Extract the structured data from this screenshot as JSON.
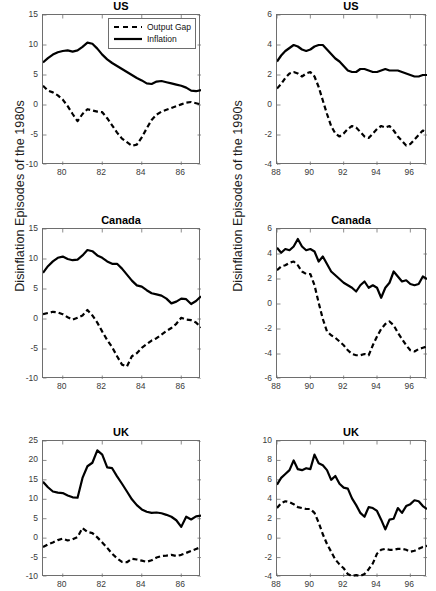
{
  "figure": {
    "row_labels": [
      "Disinflation Episodes of the 1980s",
      "Disinflation Episodes of the 1990s"
    ],
    "legend": {
      "output_gap": "Output Gap",
      "inflation": "Inflation"
    },
    "colors": {
      "line": "#000000",
      "axis": "#6e6e6e",
      "background": "#ffffff",
      "tick_text": "#3a3a3a"
    }
  },
  "chart_data": [
    {
      "id": "us-1980s",
      "type": "line",
      "title": "US",
      "xlabel": "",
      "ylabel": "",
      "xlim": [
        79,
        87
      ],
      "ylim": [
        -10,
        15
      ],
      "xticks": [
        80,
        82,
        84,
        86
      ],
      "yticks": [
        -10,
        -5,
        0,
        5,
        10,
        15
      ],
      "grid": false,
      "legend": "top-right",
      "x": [
        79,
        79.25,
        79.5,
        79.75,
        80,
        80.25,
        80.5,
        80.75,
        81,
        81.25,
        81.5,
        81.75,
        82,
        82.25,
        82.5,
        82.75,
        83,
        83.25,
        83.5,
        83.75,
        84,
        84.25,
        84.5,
        84.75,
        85,
        85.25,
        85.5,
        85.75,
        86,
        86.25,
        86.5,
        86.75,
        87
      ],
      "series": [
        {
          "name": "Inflation",
          "style": "solid",
          "values": [
            7.1,
            7.8,
            8.4,
            8.8,
            9.0,
            9.1,
            8.9,
            9.1,
            9.7,
            10.4,
            10.2,
            9.4,
            8.4,
            7.6,
            7.0,
            6.5,
            6.0,
            5.5,
            5.0,
            4.5,
            4.1,
            3.6,
            3.5,
            3.9,
            4.0,
            3.8,
            3.6,
            3.4,
            3.2,
            2.9,
            2.4,
            2.3,
            2.5
          ]
        },
        {
          "name": "Output Gap",
          "style": "dashed",
          "values": [
            3.2,
            2.4,
            2.1,
            1.6,
            0.9,
            -0.2,
            -1.5,
            -2.7,
            -1.5,
            -0.7,
            -0.9,
            -1.1,
            -1.2,
            -2.2,
            -3.4,
            -4.6,
            -5.6,
            -6.2,
            -6.8,
            -6.6,
            -5.4,
            -3.9,
            -2.5,
            -1.6,
            -1.1,
            -0.8,
            -0.5,
            -0.2,
            0.1,
            0.4,
            0.5,
            0.3,
            0.1
          ]
        }
      ]
    },
    {
      "id": "us-1990s",
      "type": "line",
      "title": "US",
      "xlabel": "",
      "ylabel": "",
      "xlim": [
        88,
        97
      ],
      "ylim": [
        -4,
        6
      ],
      "xticks": [
        88,
        90,
        92,
        94,
        96
      ],
      "yticks": [
        -4,
        -2,
        0,
        2,
        4,
        6
      ],
      "grid": false,
      "legend": "none",
      "x": [
        88,
        88.25,
        88.5,
        88.75,
        89,
        89.25,
        89.5,
        89.75,
        90,
        90.25,
        90.5,
        90.75,
        91,
        91.25,
        91.5,
        91.75,
        92,
        92.25,
        92.5,
        92.75,
        93,
        93.25,
        93.5,
        93.75,
        94,
        94.25,
        94.5,
        94.75,
        95,
        95.25,
        95.5,
        95.75,
        96,
        96.25,
        96.5,
        96.75,
        97
      ],
      "series": [
        {
          "name": "Inflation",
          "style": "solid",
          "values": [
            2.9,
            3.3,
            3.6,
            3.8,
            4.0,
            3.9,
            3.7,
            3.6,
            3.7,
            3.9,
            4.0,
            4.0,
            3.7,
            3.4,
            3.1,
            2.9,
            2.6,
            2.3,
            2.2,
            2.2,
            2.4,
            2.4,
            2.3,
            2.2,
            2.2,
            2.3,
            2.4,
            2.3,
            2.3,
            2.3,
            2.2,
            2.1,
            2.0,
            1.9,
            1.9,
            2.0,
            2.0
          ]
        },
        {
          "name": "Output Gap",
          "style": "dashed",
          "values": [
            1.1,
            1.4,
            1.8,
            2.1,
            2.2,
            2.1,
            1.9,
            2.1,
            2.2,
            1.9,
            1.2,
            0.3,
            -0.6,
            -1.4,
            -1.9,
            -2.1,
            -1.9,
            -1.6,
            -1.4,
            -1.5,
            -1.8,
            -2.1,
            -2.2,
            -1.9,
            -1.6,
            -1.4,
            -1.5,
            -1.4,
            -1.7,
            -2.1,
            -2.4,
            -2.7,
            -2.6,
            -2.3,
            -2.0,
            -1.7,
            -1.8
          ]
        }
      ]
    },
    {
      "id": "canada-1980s",
      "type": "line",
      "title": "Canada",
      "xlabel": "",
      "ylabel": "",
      "xlim": [
        79,
        87
      ],
      "ylim": [
        -10,
        15
      ],
      "xticks": [
        80,
        82,
        84,
        86
      ],
      "yticks": [
        -10,
        -5,
        0,
        5,
        10,
        15
      ],
      "grid": false,
      "legend": "none",
      "x": [
        79,
        79.25,
        79.5,
        79.75,
        80,
        80.25,
        80.5,
        80.75,
        81,
        81.25,
        81.5,
        81.75,
        82,
        82.25,
        82.5,
        82.75,
        83,
        83.25,
        83.5,
        83.75,
        84,
        84.25,
        84.5,
        84.75,
        85,
        85.25,
        85.5,
        85.75,
        86,
        86.25,
        86.5,
        86.75,
        87
      ],
      "series": [
        {
          "name": "Inflation",
          "style": "solid",
          "values": [
            7.7,
            8.8,
            9.6,
            10.2,
            10.4,
            10.0,
            9.8,
            9.9,
            10.6,
            11.5,
            11.3,
            10.6,
            10.2,
            9.6,
            9.2,
            9.2,
            8.4,
            7.4,
            6.4,
            5.6,
            5.4,
            4.8,
            4.3,
            4.1,
            3.9,
            3.4,
            2.6,
            2.9,
            3.4,
            3.3,
            2.5,
            3.0,
            3.8
          ]
        },
        {
          "name": "Output Gap",
          "style": "dashed",
          "values": [
            0.8,
            1.0,
            1.2,
            1.1,
            0.8,
            0.3,
            -0.1,
            0.2,
            0.6,
            1.5,
            0.6,
            -0.6,
            -2.1,
            -3.5,
            -4.7,
            -6.2,
            -7.6,
            -7.9,
            -6.2,
            -5.7,
            -4.8,
            -4.2,
            -3.6,
            -3.2,
            -2.6,
            -2.0,
            -1.5,
            -0.8,
            0.2,
            -0.1,
            -0.2,
            -0.6,
            -1.4
          ]
        }
      ]
    },
    {
      "id": "canada-1990s",
      "type": "line",
      "title": "Canada",
      "xlabel": "",
      "ylabel": "",
      "xlim": [
        88,
        97
      ],
      "ylim": [
        -6,
        6
      ],
      "xticks": [
        88,
        90,
        92,
        94,
        96
      ],
      "yticks": [
        -6,
        -4,
        -2,
        0,
        2,
        4,
        6
      ],
      "grid": false,
      "legend": "none",
      "x": [
        88,
        88.25,
        88.5,
        88.75,
        89,
        89.25,
        89.5,
        89.75,
        90,
        90.25,
        90.5,
        90.75,
        91,
        91.25,
        91.5,
        91.75,
        92,
        92.25,
        92.5,
        92.75,
        93,
        93.25,
        93.5,
        93.75,
        94,
        94.25,
        94.5,
        94.75,
        95,
        95.25,
        95.5,
        95.75,
        96,
        96.25,
        96.5,
        96.75,
        97
      ],
      "series": [
        {
          "name": "Inflation",
          "style": "solid",
          "values": [
            4.5,
            4.1,
            4.4,
            4.3,
            4.6,
            5.2,
            4.6,
            4.3,
            4.4,
            4.2,
            3.4,
            3.8,
            3.2,
            2.6,
            2.3,
            2.0,
            1.7,
            1.5,
            1.3,
            1.0,
            1.5,
            1.8,
            1.3,
            1.5,
            1.3,
            0.5,
            1.3,
            1.7,
            2.6,
            2.2,
            1.8,
            1.9,
            1.6,
            1.5,
            1.6,
            2.2,
            2.0
          ]
        },
        {
          "name": "Output Gap",
          "style": "dashed",
          "values": [
            2.7,
            3.0,
            3.1,
            3.3,
            3.4,
            3.1,
            2.6,
            2.4,
            2.4,
            1.5,
            0.1,
            -1.2,
            -2.2,
            -2.5,
            -2.7,
            -3.0,
            -3.3,
            -3.7,
            -4.0,
            -4.1,
            -4.1,
            -4.0,
            -4.1,
            -3.3,
            -2.6,
            -2.0,
            -1.6,
            -1.4,
            -1.7,
            -2.3,
            -2.8,
            -3.3,
            -3.7,
            -3.8,
            -3.6,
            -3.5,
            -3.4
          ]
        }
      ]
    },
    {
      "id": "uk-1980s",
      "type": "line",
      "title": "UK",
      "xlabel": "",
      "ylabel": "",
      "xlim": [
        79,
        87
      ],
      "ylim": [
        -10,
        25
      ],
      "xticks": [
        80,
        82,
        84,
        86
      ],
      "yticks": [
        -10,
        -5,
        0,
        5,
        10,
        15,
        20,
        25
      ],
      "grid": false,
      "legend": "none",
      "x": [
        79,
        79.25,
        79.5,
        79.75,
        80,
        80.25,
        80.5,
        80.75,
        81,
        81.25,
        81.5,
        81.75,
        82,
        82.25,
        82.5,
        82.75,
        83,
        83.25,
        83.5,
        83.75,
        84,
        84.25,
        84.5,
        84.75,
        85,
        85.25,
        85.5,
        85.75,
        86,
        86.25,
        86.5,
        86.75,
        87
      ],
      "series": [
        {
          "name": "Inflation",
          "style": "solid",
          "values": [
            14.5,
            13.1,
            12.0,
            11.7,
            11.6,
            11.0,
            10.5,
            10.4,
            15.5,
            18.5,
            19.4,
            22.6,
            21.5,
            18.2,
            18.0,
            15.9,
            14.0,
            12.0,
            10.0,
            8.5,
            7.4,
            6.8,
            6.5,
            6.6,
            6.4,
            6.0,
            5.5,
            4.6,
            2.9,
            5.5,
            4.8,
            5.6,
            5.8
          ]
        },
        {
          "name": "Output Gap",
          "style": "dashed",
          "values": [
            -2.3,
            -1.6,
            -1.1,
            -0.5,
            -0.1,
            -0.6,
            -0.3,
            0.3,
            2.6,
            1.6,
            1.3,
            0.2,
            -1.1,
            -2.5,
            -4.0,
            -5.2,
            -6.1,
            -6.2,
            -5.3,
            -5.5,
            -5.8,
            -6.1,
            -5.7,
            -5.0,
            -4.6,
            -4.5,
            -4.3,
            -4.6,
            -4.3,
            -3.8,
            -3.3,
            -2.8,
            -2.3
          ]
        }
      ]
    },
    {
      "id": "uk-1990s",
      "type": "line",
      "title": "UK",
      "xlabel": "",
      "ylabel": "",
      "xlim": [
        88,
        97
      ],
      "ylim": [
        -4,
        10
      ],
      "xticks": [
        88,
        90,
        92,
        94,
        96
      ],
      "yticks": [
        -4,
        -2,
        0,
        2,
        4,
        6,
        8,
        10
      ],
      "grid": false,
      "legend": "none",
      "x": [
        88,
        88.25,
        88.5,
        88.75,
        89,
        89.25,
        89.5,
        89.75,
        90,
        90.25,
        90.5,
        90.75,
        91,
        91.25,
        91.5,
        91.75,
        92,
        92.25,
        92.5,
        92.75,
        93,
        93.25,
        93.5,
        93.75,
        94,
        94.25,
        94.5,
        94.75,
        95,
        95.25,
        95.5,
        95.75,
        96,
        96.25,
        96.5,
        96.75,
        97
      ],
      "series": [
        {
          "name": "Inflation",
          "style": "solid",
          "values": [
            5.5,
            6.2,
            6.6,
            7.0,
            8.0,
            7.1,
            7.0,
            7.2,
            7.1,
            8.6,
            7.7,
            7.5,
            7.0,
            6.0,
            6.4,
            5.6,
            5.2,
            5.1,
            4.1,
            3.4,
            2.6,
            2.2,
            3.2,
            3.1,
            2.8,
            1.9,
            0.9,
            1.9,
            2.0,
            3.1,
            2.6,
            3.3,
            3.5,
            3.9,
            3.8,
            3.3,
            3.0
          ]
        },
        {
          "name": "Output Gap",
          "style": "dashed",
          "values": [
            3.1,
            3.6,
            3.8,
            3.7,
            3.5,
            3.2,
            3.1,
            3.0,
            3.0,
            2.6,
            1.6,
            0.4,
            -0.6,
            -1.4,
            -2.2,
            -2.7,
            -3.1,
            -3.7,
            -3.9,
            -3.8,
            -3.9,
            -3.7,
            -3.2,
            -2.6,
            -1.6,
            -1.2,
            -1.1,
            -1.2,
            -1.2,
            -1.1,
            -1.1,
            -1.2,
            -1.4,
            -1.3,
            -1.1,
            -0.9,
            -0.8
          ]
        }
      ]
    }
  ]
}
